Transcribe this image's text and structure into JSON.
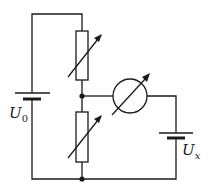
{
  "diagram": {
    "type": "circuit",
    "components": [
      {
        "id": "source-U0",
        "kind": "dc-voltage-source",
        "label": "U",
        "subscript": "0"
      },
      {
        "id": "source-Ux",
        "kind": "dc-voltage-source",
        "label": "U",
        "subscript": "x"
      },
      {
        "id": "rheostat-top",
        "kind": "variable-resistor"
      },
      {
        "id": "rheostat-bottom",
        "kind": "variable-resistor"
      },
      {
        "id": "meter",
        "kind": "adjustable-meter"
      }
    ],
    "nodes": [
      {
        "id": "junction-middle"
      },
      {
        "id": "junction-bottom"
      }
    ]
  },
  "labels": {
    "u0_main": "U",
    "u0_sub": "0",
    "ux_main": "U",
    "ux_sub": "x"
  },
  "colors": {
    "ink": "#1a1a1a",
    "background": "#ffffff"
  }
}
